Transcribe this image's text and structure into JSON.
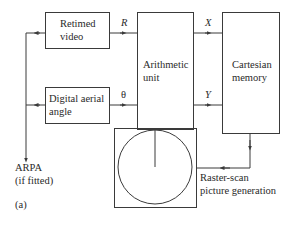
{
  "diagram": {
    "blocks": {
      "retimed_video": {
        "line1": "Retimed",
        "line2": "video"
      },
      "digital_aerial_angle": {
        "line1": "Digital aerial",
        "line2": "angle"
      },
      "arithmetic_unit": {
        "line1": "Arithmetic",
        "line2": "unit"
      },
      "cartesian_memory": {
        "line1": "Cartesian",
        "line2": "memory"
      },
      "raster_scan": {
        "line1": "Raster-scan",
        "line2": "picture generation"
      }
    },
    "signals": {
      "r": "R",
      "theta": "θ",
      "x": "X",
      "y": "Y"
    },
    "output": {
      "line1": "ARPA",
      "line2": "(if fitted)"
    },
    "figure_label": "(a)",
    "colors": {
      "line": "#3a3a3a",
      "background": "#ffffff"
    }
  }
}
